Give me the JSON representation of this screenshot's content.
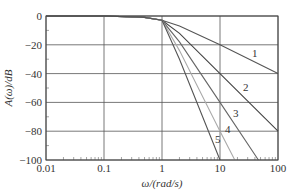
{
  "chart_data": {
    "type": "line",
    "title": "",
    "xlabel": "ω/(rad/s)",
    "ylabel": "A(ω)/dB",
    "xscale": "log",
    "xlim": [
      0.01,
      100
    ],
    "ylim": [
      -100,
      0
    ],
    "grid": true,
    "x_ticks": [
      "0.01",
      "0.1",
      "1",
      "10",
      "100"
    ],
    "y_ticks": [
      "0",
      "-20",
      "-40",
      "-60",
      "-80",
      "-100"
    ],
    "series": [
      {
        "name": "1",
        "color": "#555555",
        "x": [
          0.01,
          0.1,
          0.5,
          1,
          2,
          10,
          100
        ],
        "values": [
          0,
          0,
          -1,
          -3,
          -7,
          -20,
          -40
        ]
      },
      {
        "name": "2",
        "color": "#444444",
        "x": [
          0.01,
          0.1,
          0.5,
          1,
          2,
          10,
          100
        ],
        "values": [
          0,
          0,
          -1,
          -3,
          -12,
          -40,
          -80
        ]
      },
      {
        "name": "3",
        "color": "#666666",
        "x": [
          0.01,
          0.1,
          0.5,
          1,
          2,
          10,
          46
        ],
        "values": [
          0,
          0,
          -1,
          -3,
          -18,
          -60,
          -100
        ]
      },
      {
        "name": "4",
        "color": "#aaaaaa",
        "x": [
          0.01,
          0.1,
          0.5,
          1,
          2,
          10,
          18
        ],
        "values": [
          0,
          0,
          -1,
          -3,
          -24,
          -80,
          -100
        ]
      },
      {
        "name": "5",
        "color": "#555555",
        "x": [
          0.01,
          0.1,
          0.5,
          1,
          2,
          10
        ],
        "values": [
          0,
          0,
          -1,
          -3,
          -30,
          -100
        ]
      }
    ],
    "legend": "inline labels 1–5 on curves"
  },
  "labels": {
    "y_axis": "A(ω)/dB",
    "x_axis": "ω/(rad/s)",
    "curves": [
      "1",
      "2",
      "3",
      "4",
      "5"
    ]
  }
}
